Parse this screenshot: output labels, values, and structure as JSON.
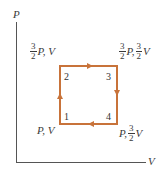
{
  "diagram": {
    "type": "pv-cycle",
    "axes": {
      "y_label": "P",
      "x_label": "V"
    },
    "cycle_color": "#c8733a",
    "axis_color": "#555555",
    "states": [
      {
        "id": "1",
        "label_num": "1",
        "pressure_coef": "",
        "volume_coef": "",
        "label_p": "P,",
        "label_v": "V",
        "position": "bottom-left"
      },
      {
        "id": "2",
        "label_num": "2",
        "pressure_frac": {
          "num": "3",
          "den": "2"
        },
        "label_p": "P,",
        "label_v": "V",
        "position": "top-left"
      },
      {
        "id": "3",
        "label_num": "3",
        "pressure_frac": {
          "num": "3",
          "den": "2"
        },
        "volume_frac": {
          "num": "3",
          "den": "2"
        },
        "label_p": "P,",
        "label_v": "V",
        "position": "top-right"
      },
      {
        "id": "4",
        "label_num": "4",
        "volume_frac": {
          "num": "3",
          "den": "2"
        },
        "label_p": "P,",
        "label_v": "V",
        "position": "bottom-right"
      }
    ],
    "process_order": [
      "1→2",
      "2→3",
      "3→4",
      "4→1"
    ]
  }
}
